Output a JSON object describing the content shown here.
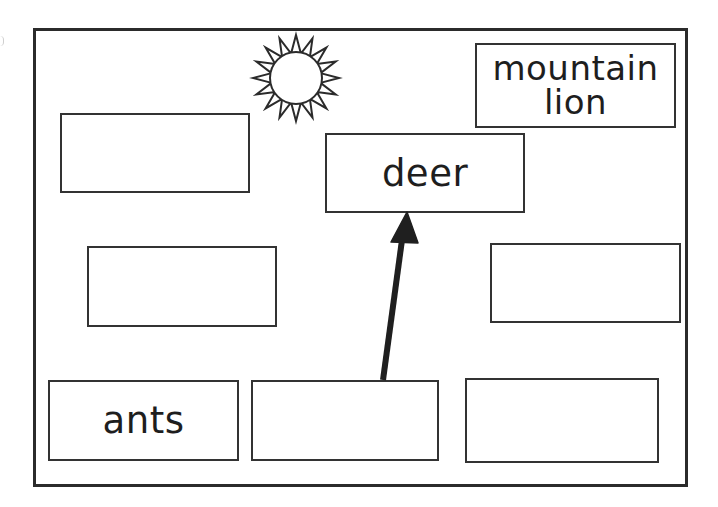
{
  "diagram": {
    "type": "food-web worksheet",
    "colors": {
      "stroke": "#2b2b2b",
      "background": "#ffffff",
      "text": "#1e1e1e"
    },
    "sun": {
      "icon": "sun-icon",
      "center": [
        296,
        78
      ],
      "inner_radius": 26,
      "outer_radius": 43,
      "rays": 16
    },
    "boxes": [
      {
        "id": "top-left",
        "label": "",
        "rect": [
          60,
          113,
          189,
          79
        ]
      },
      {
        "id": "deer",
        "label": "deer",
        "rect": [
          325,
          133,
          199,
          79
        ]
      },
      {
        "id": "mountain-lion",
        "label": "mountain\nlion",
        "rect": [
          475,
          43,
          200,
          84
        ]
      },
      {
        "id": "mid-left",
        "label": "",
        "rect": [
          87,
          246,
          189,
          80
        ]
      },
      {
        "id": "mid-right",
        "label": "",
        "rect": [
          490,
          243,
          190,
          79
        ]
      },
      {
        "id": "ants",
        "label": "ants",
        "rect": [
          48,
          380,
          190,
          80
        ]
      },
      {
        "id": "bottom-middle",
        "label": "",
        "rect": [
          251,
          380,
          187,
          80
        ]
      },
      {
        "id": "bottom-right",
        "label": "",
        "rect": [
          465,
          378,
          193,
          84
        ]
      }
    ],
    "arrows": [
      {
        "from": "bottom-middle",
        "to": "deer",
        "start": [
          383,
          380
        ],
        "end": [
          407,
          212
        ]
      }
    ]
  }
}
